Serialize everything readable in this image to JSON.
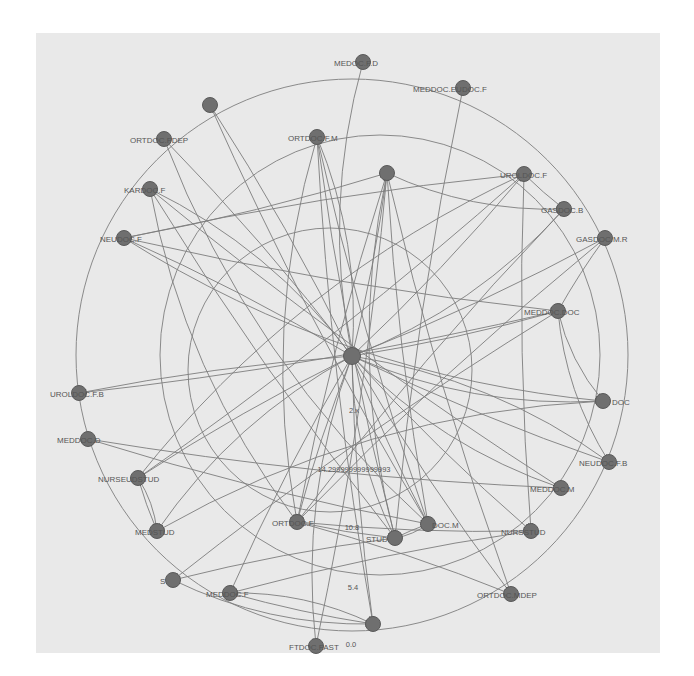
{
  "diagram": {
    "type": "directed network graph (radial layout)",
    "background_color": "#e9e9e9",
    "node_color": "#6f6f6f",
    "edge_color": "#7d7d7d",
    "rings": [
      {
        "cx": 352,
        "cy": 355,
        "r": 276
      },
      {
        "cx": 380,
        "cy": 355,
        "r": 220
      },
      {
        "cx": 330,
        "cy": 370,
        "r": 142
      }
    ],
    "nodes": [
      {
        "id": "hub",
        "label": "",
        "x": 352,
        "y": 356,
        "lx": 0,
        "ly": 0
      },
      {
        "id": "n1",
        "label": "MEDOC.F.D",
        "x": 363,
        "y": 62,
        "lx": 334,
        "ly": 66
      },
      {
        "id": "n2",
        "label": "MEDDOC.EUDOC.F",
        "x": 463,
        "y": 88,
        "lx": 413,
        "ly": 92
      },
      {
        "id": "n3",
        "label": "",
        "x": 210,
        "y": 105,
        "lx": 0,
        "ly": 0
      },
      {
        "id": "n4",
        "label": "ORTDOC.FDEP",
        "x": 164,
        "y": 139,
        "lx": 130,
        "ly": 143
      },
      {
        "id": "n5",
        "label": "ORTDOC.F.M",
        "x": 317,
        "y": 137,
        "lx": 288,
        "ly": 141
      },
      {
        "id": "n6",
        "label": "",
        "x": 387,
        "y": 173,
        "lx": 0,
        "ly": 0
      },
      {
        "id": "n7",
        "label": "UROLDOC.F",
        "x": 524,
        "y": 174,
        "lx": 500,
        "ly": 178
      },
      {
        "id": "n8",
        "label": "KARDOC.F",
        "x": 150,
        "y": 189,
        "lx": 124,
        "ly": 193
      },
      {
        "id": "n9",
        "label": "GASDOC.B",
        "x": 564,
        "y": 209,
        "lx": 541,
        "ly": 213
      },
      {
        "id": "n10",
        "label": "NEUDOC.F",
        "x": 124,
        "y": 238,
        "lx": 100,
        "ly": 242
      },
      {
        "id": "n11",
        "label": "GASDOC.M.R",
        "x": 605,
        "y": 238,
        "lx": 576,
        "ly": 242
      },
      {
        "id": "n12",
        "label": "MEDDOC.DOC",
        "x": 558,
        "y": 311,
        "lx": 524,
        "ly": 315
      },
      {
        "id": "n13",
        "label": "UROLDOC.F.B",
        "x": 79,
        "y": 393,
        "lx": 50,
        "ly": 397
      },
      {
        "id": "n14",
        "label": "DOC",
        "x": 603,
        "y": 401,
        "lx": 612,
        "ly": 405
      },
      {
        "id": "n15",
        "label": "MEDDOC.D",
        "x": 88,
        "y": 439,
        "lx": 57,
        "ly": 443
      },
      {
        "id": "n16",
        "label": "NEUDOC.F.B",
        "x": 609,
        "y": 462,
        "lx": 579,
        "ly": 466
      },
      {
        "id": "n17",
        "label": "NURSEUDSTUD",
        "x": 138,
        "y": 478,
        "lx": 98,
        "ly": 482
      },
      {
        "id": "n18",
        "label": "MEDDOC.M",
        "x": 561,
        "y": 488,
        "lx": 530,
        "ly": 492
      },
      {
        "id": "n19",
        "label": "MEDSTUD",
        "x": 157,
        "y": 531,
        "lx": 135,
        "ly": 535
      },
      {
        "id": "n20",
        "label": "ORTDOC.F",
        "x": 297,
        "y": 522,
        "lx": 272,
        "ly": 526
      },
      {
        "id": "n21",
        "label": "DOC.M",
        "x": 428,
        "y": 524,
        "lx": 432,
        "ly": 528
      },
      {
        "id": "n22",
        "label": "STUD",
        "x": 395,
        "y": 538,
        "lx": 366,
        "ly": 542
      },
      {
        "id": "n23",
        "label": "NURSSTUD",
        "x": 531,
        "y": 531,
        "lx": 501,
        "ly": 535
      },
      {
        "id": "n24",
        "label": "S",
        "x": 173,
        "y": 580,
        "lx": 160,
        "ly": 584
      },
      {
        "id": "n25",
        "label": "MEDDOC.F",
        "x": 230,
        "y": 593,
        "lx": 206,
        "ly": 597
      },
      {
        "id": "n26",
        "label": "ORTDOC.MDEP",
        "x": 511,
        "y": 594,
        "lx": 477,
        "ly": 598
      },
      {
        "id": "n27",
        "label": "",
        "x": 373,
        "y": 624,
        "lx": 0,
        "ly": 0
      },
      {
        "id": "n28",
        "label": "FTDOC.FAST",
        "x": 316,
        "y": 646,
        "lx": 289,
        "ly": 650
      }
    ],
    "edge_labels": [
      {
        "text": "2.x",
        "x": 354,
        "y": 413
      },
      {
        "text": "14.299999999999993",
        "x": 354,
        "y": 472
      },
      {
        "text": "10.8",
        "x": 352,
        "y": 530
      },
      {
        "text": "5.4",
        "x": 353,
        "y": 590
      },
      {
        "text": "0.0",
        "x": 351,
        "y": 647
      }
    ],
    "edges": [
      [
        "hub",
        "n5"
      ],
      [
        "hub",
        "n6"
      ],
      [
        "hub",
        "n7"
      ],
      [
        "hub",
        "n9"
      ],
      [
        "hub",
        "n11"
      ],
      [
        "hub",
        "n12"
      ],
      [
        "hub",
        "n14"
      ],
      [
        "hub",
        "n13"
      ],
      [
        "hub",
        "n17"
      ],
      [
        "hub",
        "n19"
      ],
      [
        "hub",
        "n20"
      ],
      [
        "hub",
        "n21"
      ],
      [
        "hub",
        "n22"
      ],
      [
        "hub",
        "n23"
      ],
      [
        "hub",
        "n25"
      ],
      [
        "hub",
        "n28"
      ],
      [
        "hub",
        "n10"
      ],
      [
        "hub",
        "n4"
      ],
      [
        "hub",
        "n8"
      ],
      [
        "hub",
        "n3"
      ],
      [
        "hub",
        "n16"
      ],
      [
        "hub",
        "n18"
      ],
      [
        "hub",
        "n26"
      ],
      [
        "hub",
        "n27"
      ],
      [
        "n1",
        "hub"
      ],
      [
        "n2",
        "n22"
      ],
      [
        "n3",
        "n21"
      ],
      [
        "n4",
        "n21"
      ],
      [
        "n5",
        "n21"
      ],
      [
        "n5",
        "n22"
      ],
      [
        "n5",
        "n20"
      ],
      [
        "n5",
        "n27"
      ],
      [
        "n6",
        "n20"
      ],
      [
        "n6",
        "n22"
      ],
      [
        "n6",
        "n21"
      ],
      [
        "n6",
        "n26"
      ],
      [
        "n6",
        "n9"
      ],
      [
        "n7",
        "n23"
      ],
      [
        "n7",
        "n10"
      ],
      [
        "n7",
        "n17"
      ],
      [
        "n8",
        "n22"
      ],
      [
        "n8",
        "n18"
      ],
      [
        "n8",
        "n20"
      ],
      [
        "n9",
        "n20"
      ],
      [
        "n10",
        "n12"
      ],
      [
        "n10",
        "n14"
      ],
      [
        "n10",
        "n6"
      ],
      [
        "n11",
        "n20"
      ],
      [
        "n12",
        "n14"
      ],
      [
        "n12",
        "n24"
      ],
      [
        "n13",
        "n12"
      ],
      [
        "n14",
        "n19"
      ],
      [
        "n15",
        "n18"
      ],
      [
        "n15",
        "n21"
      ],
      [
        "n16",
        "hub"
      ],
      [
        "n17",
        "n7"
      ],
      [
        "n17",
        "n19"
      ],
      [
        "n19",
        "n17"
      ],
      [
        "n20",
        "n22"
      ],
      [
        "n21",
        "n22"
      ],
      [
        "n22",
        "n21"
      ],
      [
        "n22",
        "n24"
      ],
      [
        "n23",
        "n25"
      ],
      [
        "n24",
        "n27"
      ],
      [
        "n25",
        "n27"
      ],
      [
        "n26",
        "n20"
      ],
      [
        "n27",
        "n25"
      ],
      [
        "n28",
        "n6"
      ],
      [
        "n11",
        "n12"
      ],
      [
        "n12",
        "n16"
      ],
      [
        "n7",
        "n9"
      ],
      [
        "n20",
        "n23"
      ]
    ]
  }
}
